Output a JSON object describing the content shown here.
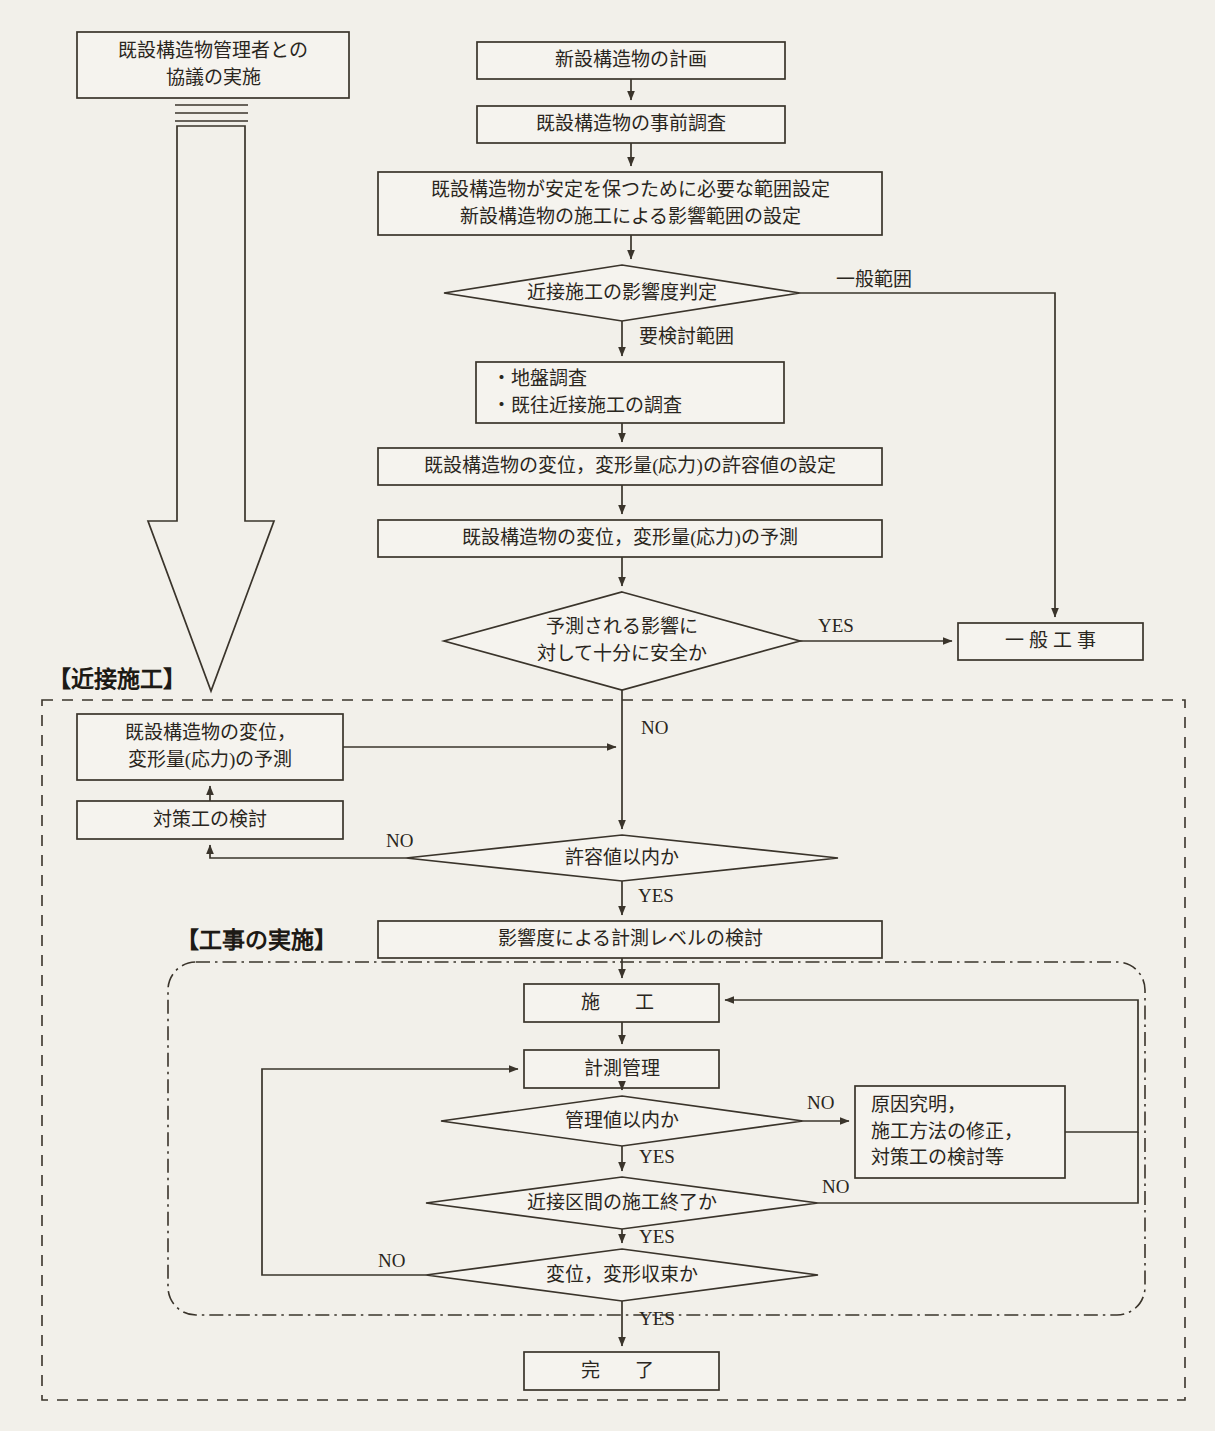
{
  "meta": {
    "kind": "flowchart",
    "language": "ja",
    "line_color": "#3a342b",
    "text_color": "#2a2620",
    "background": "#f2f0ea"
  },
  "regions": [
    {
      "id": "close-construction",
      "title": "【近接施工】",
      "border": "dashed"
    },
    {
      "id": "work-execution",
      "title": "【工事の実施】",
      "border": "dash-dot"
    }
  ],
  "nodes": {
    "consultation": {
      "label": "既設構造物管理者との\n協議の実施",
      "shape": "box"
    },
    "plan_new": {
      "label": "新設構造物の計画",
      "shape": "box"
    },
    "pre_survey": {
      "label": "既設構造物の事前調査",
      "shape": "box"
    },
    "range_setting": {
      "label": "既設構造物が安定を保つために必要な範囲設定\n新設構造物の施工による影響範囲の設定",
      "shape": "box"
    },
    "impact_judgement": {
      "label": "近接施工の影響度判定",
      "shape": "diamond"
    },
    "surveys": {
      "label": "・地盤調査\n・既往近接施工の調査",
      "shape": "box"
    },
    "allowable_setting": {
      "label": "既設構造物の変位，変形量(応力)の許容値の設定",
      "shape": "box"
    },
    "prediction_1": {
      "label": "既設構造物の変位，変形量(応力)の予測",
      "shape": "box"
    },
    "safe_enough": {
      "label": "予測される影響に\n対して十分に安全か",
      "shape": "diamond"
    },
    "general_work": {
      "label": "一 般 工 事",
      "shape": "box"
    },
    "prediction_2": {
      "label": "既設構造物の変位，\n変形量(応力)の予測",
      "shape": "box"
    },
    "countermeasure": {
      "label": "対策工の検討",
      "shape": "box"
    },
    "within_allowable": {
      "label": "許容値以内か",
      "shape": "diamond"
    },
    "measure_level": {
      "label": "影響度による計測レベルの検討",
      "shape": "box"
    },
    "construction": {
      "label": "施　工",
      "shape": "box"
    },
    "measurement_mgmt": {
      "label": "計測管理",
      "shape": "box"
    },
    "within_control": {
      "label": "管理値以内か",
      "shape": "diamond"
    },
    "cause_investigation": {
      "label": "原因究明，\n施工方法の修正，\n対策工の検討等",
      "shape": "box"
    },
    "section_finished": {
      "label": "近接区間の施工終了か",
      "shape": "diamond"
    },
    "displacement_converged": {
      "label": "変位，変形収束か",
      "shape": "diamond"
    },
    "complete": {
      "label": "完　了",
      "shape": "box"
    }
  },
  "edge_labels": {
    "general_range": "一般範囲",
    "needs_review": "要検討範囲",
    "yes_safe": "YES",
    "no_safe": "NO",
    "no_allowable": "NO",
    "yes_allowable": "YES",
    "no_control": "NO",
    "yes_control": "YES",
    "no_section": "NO",
    "yes_section": "YES",
    "no_converged": "NO",
    "yes_converged": "YES"
  }
}
